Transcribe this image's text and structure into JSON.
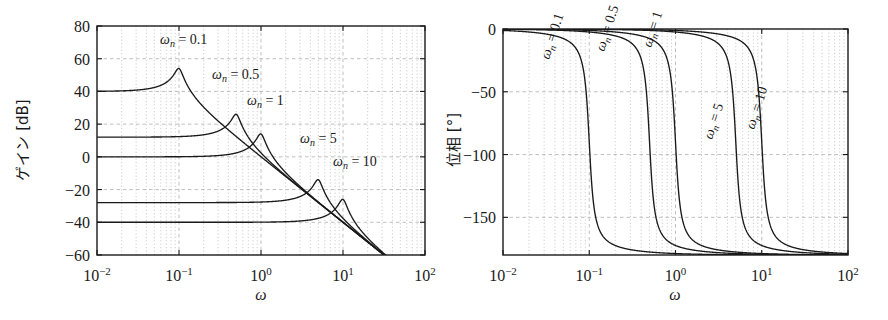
{
  "figure": {
    "kind": "bode-plot-pair",
    "background": "#ffffff",
    "line_color": "#1a1a1a",
    "grid_color": "#b8b8b8",
    "axis_color": "#1a1a1a"
  },
  "gain_panel": {
    "y_axis_label": "ゲイン [dB]",
    "x_axis_label": "ω",
    "x_tick_labels": [
      "10⁻²",
      "10⁻¹",
      "10⁰",
      "10¹",
      "10²"
    ],
    "y_tick_labels": [
      "80",
      "60",
      "40",
      "20",
      "0",
      "−20",
      "−40",
      "−60"
    ],
    "annotations": [
      {
        "text": "ωₙ = 0.1",
        "omega_n": 0.1
      },
      {
        "text": "ωₙ = 0.5",
        "omega_n": 0.5
      },
      {
        "text": "ωₙ = 1",
        "omega_n": 1
      },
      {
        "text": "ωₙ = 5",
        "omega_n": 5
      },
      {
        "text": "ωₙ = 10",
        "omega_n": 10
      }
    ]
  },
  "phase_panel": {
    "y_axis_label": "位相 [°]",
    "x_axis_label": "ω",
    "x_tick_labels": [
      "10⁻²",
      "10⁻¹",
      "10⁰",
      "10¹",
      "10²"
    ],
    "y_tick_labels": [
      "0",
      "−50",
      "−100",
      "−150"
    ],
    "annotations": [
      {
        "text": "ωₙ = 0.1",
        "omega_n": 0.1
      },
      {
        "text": "ωₙ = 0.5",
        "omega_n": 0.5
      },
      {
        "text": "ωₙ = 1",
        "omega_n": 1
      },
      {
        "text": "ωₙ = 5",
        "omega_n": 5
      },
      {
        "text": "ωₙ = 10",
        "omega_n": 10
      }
    ]
  },
  "chart_data": [
    {
      "type": "line",
      "id": "gain",
      "title": "",
      "xlabel": "ω",
      "ylabel": "ゲイン [dB]",
      "xscale": "log",
      "xlim": [
        0.01,
        100
      ],
      "ylim": [
        -60,
        80
      ],
      "ytick": [
        -60,
        -40,
        -20,
        0,
        20,
        40,
        60,
        80
      ],
      "xtick": [
        0.01,
        0.1,
        1,
        10,
        100
      ],
      "grid": true,
      "grid_minor": true,
      "legend": "none",
      "model": "20*log10( K / |(jw)^2 + 2*z*wn*(jw) + wn^2| ),  K = 1, z = 0.1",
      "series": [
        {
          "name": "ωₙ = 0.1",
          "omega_n": 0.1,
          "zeta": 0.1,
          "dc_gain_db": 60,
          "peak_omega": 0.1,
          "peak_gain_db": 74,
          "x": [
            0.01,
            0.02,
            0.05,
            0.08,
            0.1,
            0.12,
            0.2,
            0.5,
            1,
            5,
            10,
            100
          ],
          "y": [
            60.0,
            60.2,
            61.9,
            67.0,
            74.0,
            66.6,
            50.5,
            32.1,
            20.0,
            -8.0,
            -20.0,
            -60.0
          ]
        },
        {
          "name": "ωₙ = 0.5",
          "omega_n": 0.5,
          "zeta": 0.1,
          "dc_gain_db": 32,
          "peak_omega": 0.5,
          "peak_gain_db": 46,
          "x": [
            0.01,
            0.1,
            0.3,
            0.4,
            0.5,
            0.6,
            1,
            2,
            5,
            10,
            100
          ],
          "y": [
            32.0,
            32.2,
            34.0,
            38.3,
            46.0,
            38.6,
            22.5,
            8.5,
            -8.0,
            -20.0,
            -60.0
          ]
        },
        {
          "name": "ωₙ = 1",
          "omega_n": 1,
          "zeta": 0.1,
          "dc_gain_db": 20,
          "peak_omega": 1,
          "peak_gain_db": 34,
          "x": [
            0.01,
            0.1,
            0.5,
            0.8,
            1,
            1.2,
            2,
            5,
            10,
            100
          ],
          "y": [
            20.0,
            20.1,
            22.5,
            26.2,
            34.0,
            26.7,
            10.5,
            -8.0,
            -20.0,
            -60.0
          ]
        },
        {
          "name": "ωₙ = 5",
          "omega_n": 5,
          "zeta": 0.1,
          "dc_gain_db": -8,
          "peak_omega": 5,
          "peak_gain_db": 6,
          "x": [
            0.01,
            0.5,
            2,
            4,
            5,
            6,
            10,
            20,
            100
          ],
          "y": [
            -8.0,
            -8.0,
            -6.5,
            -2.2,
            6.0,
            -1.6,
            -14.0,
            -26.0,
            -60.0
          ]
        },
        {
          "name": "ωₙ = 10",
          "omega_n": 10,
          "zeta": 0.1,
          "dc_gain_db": -20,
          "peak_omega": 10,
          "peak_gain_db": -6,
          "x": [
            0.01,
            1,
            5,
            8,
            10,
            12,
            20,
            50,
            100
          ],
          "y": [
            -20.0,
            -19.9,
            -17.5,
            -13.8,
            -6.0,
            -13.3,
            -32.0,
            -48.0,
            -60.0
          ]
        }
      ]
    },
    {
      "type": "line",
      "id": "phase",
      "title": "",
      "xlabel": "ω",
      "ylabel": "位相 [°]",
      "xscale": "log",
      "xlim": [
        0.01,
        100
      ],
      "ylim": [
        -180,
        0
      ],
      "ytick": [
        -150,
        -100,
        -50,
        0
      ],
      "xtick": [
        0.01,
        0.1,
        1,
        10,
        100
      ],
      "grid": true,
      "grid_minor": true,
      "legend": "none",
      "model": "arg( K / ((jw)^2 + 2*z*wn*(jw) + wn^2) ),  z = 0.1",
      "series": [
        {
          "name": "ωₙ = 0.1",
          "omega_n": 0.1,
          "zeta": 0.1,
          "x": [
            0.01,
            0.05,
            0.08,
            0.1,
            0.12,
            0.2,
            0.5,
            1,
            100
          ],
          "y": [
            -0.1,
            -0.8,
            -2.5,
            -90.0,
            -177.0,
            -178.5,
            -179.6,
            -179.8,
            -180.0
          ]
        },
        {
          "name": "ωₙ = 0.5",
          "omega_n": 0.5,
          "zeta": 0.1,
          "x": [
            0.01,
            0.2,
            0.4,
            0.5,
            0.6,
            1,
            5,
            100
          ],
          "y": [
            -0.1,
            -0.9,
            -2.6,
            -90.0,
            -177.2,
            -178.9,
            -179.8,
            -180.0
          ]
        },
        {
          "name": "ωₙ = 1",
          "omega_n": 1,
          "zeta": 0.1,
          "x": [
            0.01,
            0.5,
            0.8,
            1,
            1.2,
            2,
            10,
            100
          ],
          "y": [
            -0.1,
            -1.0,
            -2.8,
            -90.0,
            -177.4,
            -179.0,
            -179.9,
            -180.0
          ]
        },
        {
          "name": "ωₙ = 5",
          "omega_n": 5,
          "zeta": 0.1,
          "x": [
            0.01,
            2,
            4,
            5,
            6,
            10,
            50,
            100
          ],
          "y": [
            -0.1,
            -1.0,
            -2.7,
            -90.0,
            -177.3,
            -178.8,
            -179.9,
            -180.0
          ]
        },
        {
          "name": "ωₙ = 10",
          "omega_n": 10,
          "zeta": 0.1,
          "x": [
            0.01,
            5,
            8,
            10,
            12,
            20,
            100
          ],
          "y": [
            -0.1,
            -1.1,
            -2.9,
            -90.0,
            -177.5,
            -179.1,
            -180.0
          ]
        }
      ]
    }
  ]
}
